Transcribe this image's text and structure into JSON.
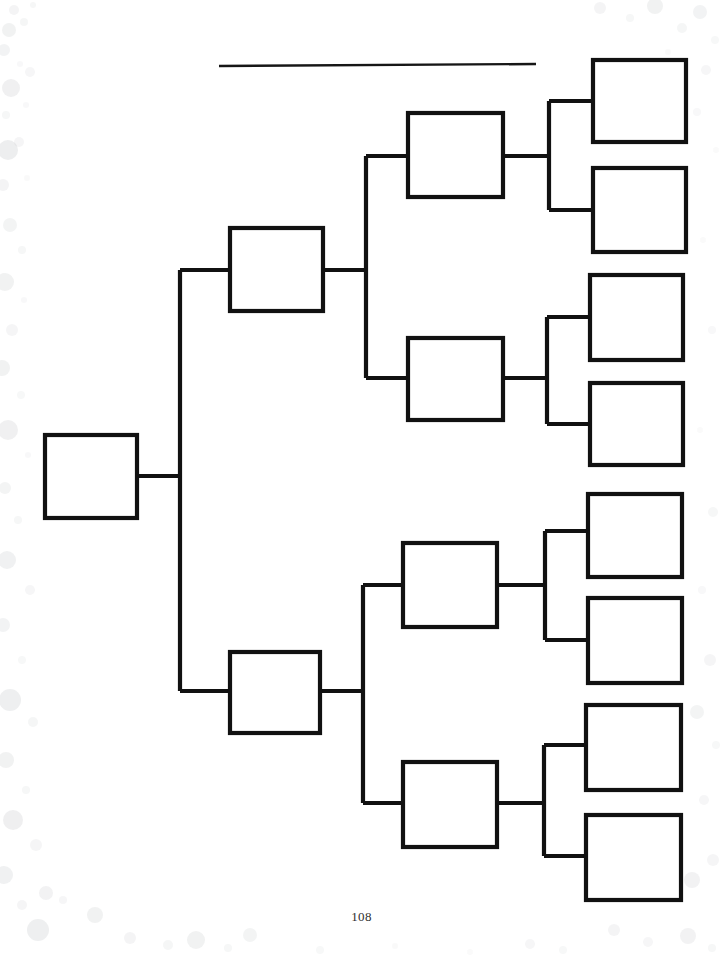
{
  "page": {
    "page_number": "108",
    "background_color": "#ffffff",
    "ink_color": "#111111",
    "speckle_color": "#b9bcc0",
    "width": 723,
    "height": 958
  },
  "title_rule": {
    "name": "blank-title-line",
    "value": "",
    "placeholder": "",
    "x1": 219,
    "y1": 66,
    "x2": 536,
    "y2": 64
  },
  "chart_data": {
    "type": "diagram",
    "subtype": "bracket-pedigree",
    "title": "",
    "generations": 4,
    "total_boxes": 15,
    "orientation": "left-to-right",
    "fill_values_present": false,
    "boxes": [
      {
        "id": "g1-1",
        "generation": 1,
        "index": 0,
        "label": "",
        "x": 45,
        "y": 435,
        "w": 92,
        "h": 83
      },
      {
        "id": "g2-1",
        "generation": 2,
        "index": 0,
        "label": "",
        "x": 230,
        "y": 228,
        "w": 93,
        "h": 83
      },
      {
        "id": "g2-2",
        "generation": 2,
        "index": 1,
        "label": "",
        "x": 230,
        "y": 652,
        "w": 90,
        "h": 81
      },
      {
        "id": "g3-1",
        "generation": 3,
        "index": 0,
        "label": "",
        "x": 408,
        "y": 113,
        "w": 95,
        "h": 84
      },
      {
        "id": "g3-2",
        "generation": 3,
        "index": 1,
        "label": "",
        "x": 408,
        "y": 338,
        "w": 95,
        "h": 82
      },
      {
        "id": "g3-3",
        "generation": 3,
        "index": 2,
        "label": "",
        "x": 403,
        "y": 543,
        "w": 94,
        "h": 84
      },
      {
        "id": "g3-4",
        "generation": 3,
        "index": 3,
        "label": "",
        "x": 403,
        "y": 762,
        "w": 94,
        "h": 85
      },
      {
        "id": "g4-1",
        "generation": 4,
        "index": 0,
        "label": "",
        "x": 593,
        "y": 60,
        "w": 93,
        "h": 82
      },
      {
        "id": "g4-2",
        "generation": 4,
        "index": 1,
        "label": "",
        "x": 593,
        "y": 168,
        "w": 93,
        "h": 84
      },
      {
        "id": "g4-3",
        "generation": 4,
        "index": 2,
        "label": "",
        "x": 590,
        "y": 275,
        "w": 93,
        "h": 85
      },
      {
        "id": "g4-4",
        "generation": 4,
        "index": 3,
        "label": "",
        "x": 590,
        "y": 383,
        "w": 93,
        "h": 82
      },
      {
        "id": "g4-5",
        "generation": 4,
        "index": 4,
        "label": "",
        "x": 588,
        "y": 494,
        "w": 94,
        "h": 83
      },
      {
        "id": "g4-6",
        "generation": 4,
        "index": 5,
        "label": "",
        "x": 588,
        "y": 598,
        "w": 94,
        "h": 85
      },
      {
        "id": "g4-7",
        "generation": 4,
        "index": 6,
        "label": "",
        "x": 586,
        "y": 705,
        "w": 95,
        "h": 85
      },
      {
        "id": "g4-8",
        "generation": 4,
        "index": 7,
        "label": "",
        "x": 586,
        "y": 815,
        "w": 95,
        "h": 85
      }
    ],
    "links": [
      {
        "id": "l-root-stub",
        "d": "M 137 476 L 180 476"
      },
      {
        "id": "l-root-spine",
        "d": "M 180 270 L 180 691"
      },
      {
        "id": "l-g2-1-in",
        "d": "M 180 270 L 230 270"
      },
      {
        "id": "l-g2-2-in",
        "d": "M 180 691 L 230 691"
      },
      {
        "id": "l-g2-1-out",
        "d": "M 323 270 L 366 270"
      },
      {
        "id": "l-g2-1-spine",
        "d": "M 366 156 L 366 378"
      },
      {
        "id": "l-g3-1-in",
        "d": "M 366 156 L 408 156"
      },
      {
        "id": "l-g3-2-in",
        "d": "M 366 378 L 408 378"
      },
      {
        "id": "l-g2-2-out",
        "d": "M 320 691 L 363 691"
      },
      {
        "id": "l-g2-2-spine",
        "d": "M 363 585 L 363 803"
      },
      {
        "id": "l-g3-3-in",
        "d": "M 363 585 L 403 585"
      },
      {
        "id": "l-g3-4-in",
        "d": "M 363 803 L 403 803"
      },
      {
        "id": "l-g3-1-out",
        "d": "M 503 156 L 549 156"
      },
      {
        "id": "l-g3-1-spine",
        "d": "M 549 101 L 549 210"
      },
      {
        "id": "l-g4-1-in",
        "d": "M 549 101 L 593 101"
      },
      {
        "id": "l-g4-2-in",
        "d": "M 549 210 L 593 210"
      },
      {
        "id": "l-g3-2-out",
        "d": "M 503 378 L 547 378"
      },
      {
        "id": "l-g3-2-spine",
        "d": "M 547 317 L 547 424"
      },
      {
        "id": "l-g4-3-in",
        "d": "M 547 317 L 590 317"
      },
      {
        "id": "l-g4-4-in",
        "d": "M 547 424 L 590 424"
      },
      {
        "id": "l-g3-3-out",
        "d": "M 497 585 L 545 585"
      },
      {
        "id": "l-g3-3-spine",
        "d": "M 545 531 L 545 640"
      },
      {
        "id": "l-g4-5-in",
        "d": "M 545 531 L 588 531"
      },
      {
        "id": "l-g4-6-in",
        "d": "M 545 640 L 588 640"
      },
      {
        "id": "l-g3-4-out",
        "d": "M 497 803 L 544 803"
      },
      {
        "id": "l-g3-4-spine",
        "d": "M 544 745 L 544 856"
      },
      {
        "id": "l-g4-7-in",
        "d": "M 544 745 L 586 745"
      },
      {
        "id": "l-g4-8-in",
        "d": "M 544 856 L 586 856"
      }
    ]
  },
  "speckles": [
    {
      "cx": 14,
      "cy": 10,
      "r": 5,
      "o": 0.16
    },
    {
      "cx": 33,
      "cy": 5,
      "r": 3,
      "o": 0.12
    },
    {
      "cx": 9,
      "cy": 30,
      "r": 7,
      "o": 0.2
    },
    {
      "cx": 24,
      "cy": 22,
      "r": 4,
      "o": 0.14
    },
    {
      "cx": 4,
      "cy": 50,
      "r": 6,
      "o": 0.18
    },
    {
      "cx": 20,
      "cy": 64,
      "r": 3,
      "o": 0.1
    },
    {
      "cx": 11,
      "cy": 88,
      "r": 9,
      "o": 0.22
    },
    {
      "cx": 30,
      "cy": 72,
      "r": 5,
      "o": 0.13
    },
    {
      "cx": 6,
      "cy": 115,
      "r": 4,
      "o": 0.12
    },
    {
      "cx": 26,
      "cy": 105,
      "r": 3,
      "o": 0.1
    },
    {
      "cx": 8,
      "cy": 150,
      "r": 10,
      "o": 0.25
    },
    {
      "cx": 19,
      "cy": 142,
      "r": 5,
      "o": 0.15
    },
    {
      "cx": 3,
      "cy": 185,
      "r": 6,
      "o": 0.16
    },
    {
      "cx": 27,
      "cy": 178,
      "r": 3,
      "o": 0.09
    },
    {
      "cx": 10,
      "cy": 225,
      "r": 7,
      "o": 0.17
    },
    {
      "cx": 22,
      "cy": 250,
      "r": 4,
      "o": 0.12
    },
    {
      "cx": 5,
      "cy": 282,
      "r": 9,
      "o": 0.2
    },
    {
      "cx": 24,
      "cy": 300,
      "r": 3,
      "o": 0.1
    },
    {
      "cx": 12,
      "cy": 330,
      "r": 6,
      "o": 0.15
    },
    {
      "cx": 2,
      "cy": 368,
      "r": 8,
      "o": 0.2
    },
    {
      "cx": 21,
      "cy": 395,
      "r": 4,
      "o": 0.11
    },
    {
      "cx": 8,
      "cy": 430,
      "r": 10,
      "o": 0.22
    },
    {
      "cx": 28,
      "cy": 455,
      "r": 3,
      "o": 0.1
    },
    {
      "cx": 5,
      "cy": 488,
      "r": 6,
      "o": 0.17
    },
    {
      "cx": 18,
      "cy": 520,
      "r": 4,
      "o": 0.12
    },
    {
      "cx": 7,
      "cy": 560,
      "r": 9,
      "o": 0.21
    },
    {
      "cx": 30,
      "cy": 590,
      "r": 5,
      "o": 0.13
    },
    {
      "cx": 3,
      "cy": 625,
      "r": 7,
      "o": 0.18
    },
    {
      "cx": 22,
      "cy": 660,
      "r": 4,
      "o": 0.11
    },
    {
      "cx": 10,
      "cy": 700,
      "r": 11,
      "o": 0.24
    },
    {
      "cx": 33,
      "cy": 722,
      "r": 5,
      "o": 0.14
    },
    {
      "cx": 6,
      "cy": 760,
      "r": 8,
      "o": 0.2
    },
    {
      "cx": 26,
      "cy": 790,
      "r": 4,
      "o": 0.12
    },
    {
      "cx": 13,
      "cy": 820,
      "r": 10,
      "o": 0.23
    },
    {
      "cx": 36,
      "cy": 845,
      "r": 6,
      "o": 0.15
    },
    {
      "cx": 4,
      "cy": 875,
      "r": 9,
      "o": 0.21
    },
    {
      "cx": 46,
      "cy": 893,
      "r": 7,
      "o": 0.19
    },
    {
      "cx": 22,
      "cy": 905,
      "r": 5,
      "o": 0.15
    },
    {
      "cx": 63,
      "cy": 900,
      "r": 4,
      "o": 0.13
    },
    {
      "cx": 95,
      "cy": 915,
      "r": 8,
      "o": 0.2
    },
    {
      "cx": 130,
      "cy": 938,
      "r": 6,
      "o": 0.16
    },
    {
      "cx": 168,
      "cy": 945,
      "r": 5,
      "o": 0.14
    },
    {
      "cx": 196,
      "cy": 940,
      "r": 9,
      "o": 0.2
    },
    {
      "cx": 228,
      "cy": 948,
      "r": 4,
      "o": 0.12
    },
    {
      "cx": 250,
      "cy": 935,
      "r": 7,
      "o": 0.17
    },
    {
      "cx": 320,
      "cy": 950,
      "r": 4,
      "o": 0.11
    },
    {
      "cx": 395,
      "cy": 946,
      "r": 3,
      "o": 0.09
    },
    {
      "cx": 470,
      "cy": 952,
      "r": 3,
      "o": 0.08
    },
    {
      "cx": 530,
      "cy": 944,
      "r": 5,
      "o": 0.13
    },
    {
      "cx": 563,
      "cy": 950,
      "r": 4,
      "o": 0.11
    },
    {
      "cx": 614,
      "cy": 930,
      "r": 6,
      "o": 0.16
    },
    {
      "cx": 648,
      "cy": 942,
      "r": 5,
      "o": 0.13
    },
    {
      "cx": 688,
      "cy": 936,
      "r": 8,
      "o": 0.19
    },
    {
      "cx": 712,
      "cy": 948,
      "r": 4,
      "o": 0.12
    },
    {
      "cx": 600,
      "cy": 8,
      "r": 6,
      "o": 0.16
    },
    {
      "cx": 630,
      "cy": 18,
      "r": 4,
      "o": 0.12
    },
    {
      "cx": 655,
      "cy": 6,
      "r": 8,
      "o": 0.2
    },
    {
      "cx": 682,
      "cy": 28,
      "r": 5,
      "o": 0.14
    },
    {
      "cx": 700,
      "cy": 12,
      "r": 7,
      "o": 0.18
    },
    {
      "cx": 715,
      "cy": 40,
      "r": 4,
      "o": 0.11
    },
    {
      "cx": 668,
      "cy": 52,
      "r": 3,
      "o": 0.09
    },
    {
      "cx": 706,
      "cy": 70,
      "r": 5,
      "o": 0.13
    },
    {
      "cx": 697,
      "cy": 112,
      "r": 4,
      "o": 0.1
    },
    {
      "cx": 716,
      "cy": 150,
      "r": 3,
      "o": 0.08
    },
    {
      "cx": 703,
      "cy": 240,
      "r": 3,
      "o": 0.08
    },
    {
      "cx": 712,
      "cy": 330,
      "r": 4,
      "o": 0.1
    },
    {
      "cx": 700,
      "cy": 430,
      "r": 3,
      "o": 0.08
    },
    {
      "cx": 713,
      "cy": 512,
      "r": 5,
      "o": 0.12
    },
    {
      "cx": 702,
      "cy": 590,
      "r": 4,
      "o": 0.1
    },
    {
      "cx": 710,
      "cy": 660,
      "r": 6,
      "o": 0.15
    },
    {
      "cx": 697,
      "cy": 712,
      "r": 7,
      "o": 0.17
    },
    {
      "cx": 716,
      "cy": 745,
      "r": 4,
      "o": 0.11
    },
    {
      "cx": 704,
      "cy": 800,
      "r": 5,
      "o": 0.13
    },
    {
      "cx": 713,
      "cy": 860,
      "r": 6,
      "o": 0.15
    },
    {
      "cx": 692,
      "cy": 880,
      "r": 8,
      "o": 0.19
    },
    {
      "cx": 38,
      "cy": 930,
      "r": 11,
      "o": 0.24
    }
  ]
}
